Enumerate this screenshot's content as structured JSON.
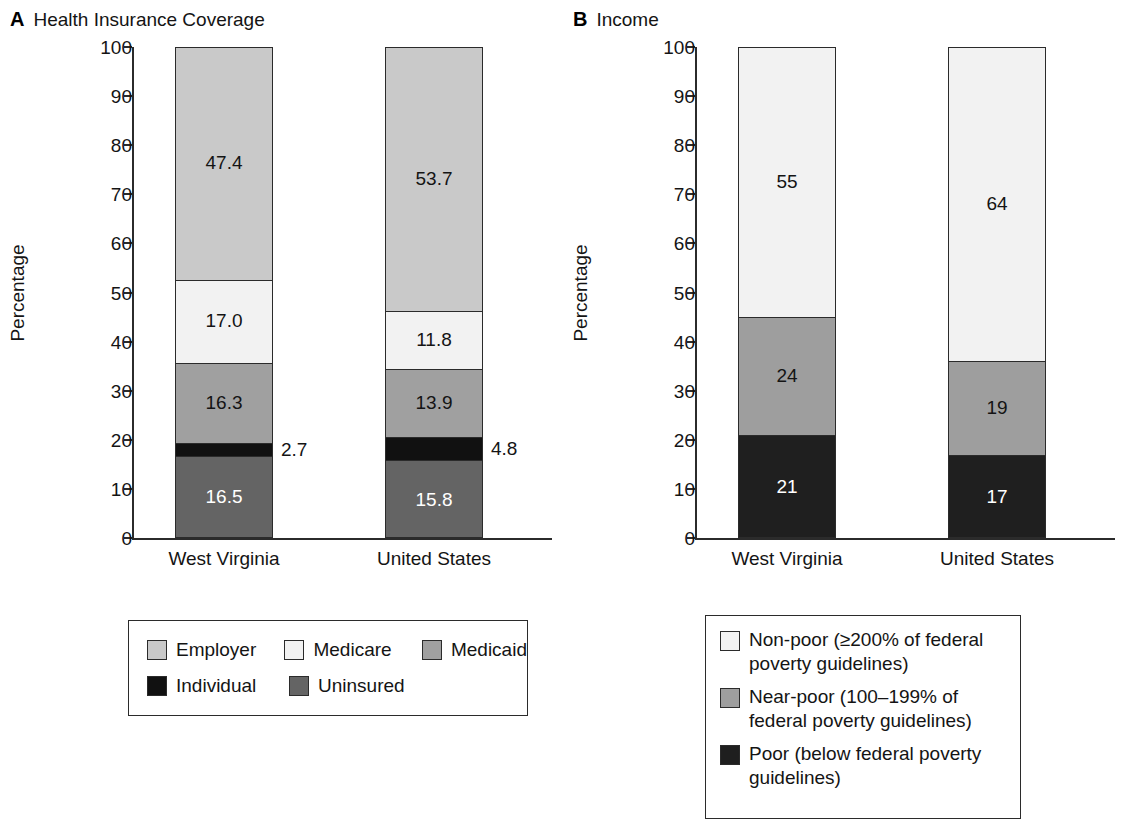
{
  "figure": {
    "background": "#ffffff"
  },
  "colors": {
    "employer": "#c9c9c9",
    "medicare": "#f2f2f2",
    "medicaid": "#a0a0a0",
    "individual": "#111111",
    "uninsured": "#646464",
    "non_poor": "#f2f2f2",
    "near_poor": "#9e9e9e",
    "poor": "#1f1f1f",
    "axis": "#2b2b2b",
    "text": "#141414"
  },
  "panels": [
    {
      "letter": "A",
      "title": "Health Insurance Coverage",
      "ylabel": "Percentage",
      "yticks": [
        "0",
        "10",
        "20",
        "30",
        "40",
        "50",
        "60",
        "70",
        "80",
        "90",
        "100"
      ],
      "categories": [
        "West Virginia",
        "United States"
      ],
      "legend": {
        "rows": [
          [
            {
              "label": "Employer",
              "color": "#c9c9c9"
            },
            {
              "label": "Medicare",
              "color": "#f2f2f2"
            },
            {
              "label": "Medicaid",
              "color": "#a0a0a0"
            }
          ],
          [
            {
              "label": "Individual",
              "color": "#111111"
            },
            {
              "label": "Uninsured",
              "color": "#646464"
            }
          ]
        ]
      },
      "bars": [
        {
          "category": "West Virginia",
          "segments": [
            {
              "name": "Employer",
              "value": 47.4,
              "label": "47.4",
              "color": "#c9c9c9",
              "label_color": "dark",
              "label_position": "inside"
            },
            {
              "name": "Medicare",
              "value": 17.0,
              "label": "17.0",
              "color": "#f2f2f2",
              "label_color": "dark",
              "label_position": "inside"
            },
            {
              "name": "Medicaid",
              "value": 16.3,
              "label": "16.3",
              "color": "#a0a0a0",
              "label_color": "dark",
              "label_position": "inside"
            },
            {
              "name": "Individual",
              "value": 2.7,
              "label": "2.7",
              "color": "#111111",
              "label_color": "dark",
              "label_position": "outside"
            },
            {
              "name": "Uninsured",
              "value": 16.5,
              "label": "16.5",
              "color": "#646464",
              "label_color": "light",
              "label_position": "inside"
            }
          ]
        },
        {
          "category": "United States",
          "segments": [
            {
              "name": "Employer",
              "value": 53.7,
              "label": "53.7",
              "color": "#c9c9c9",
              "label_color": "dark",
              "label_position": "inside"
            },
            {
              "name": "Medicare",
              "value": 11.8,
              "label": "11.8",
              "color": "#f2f2f2",
              "label_color": "dark",
              "label_position": "inside"
            },
            {
              "name": "Medicaid",
              "value": 13.9,
              "label": "13.9",
              "color": "#a0a0a0",
              "label_color": "dark",
              "label_position": "inside"
            },
            {
              "name": "Individual",
              "value": 4.8,
              "label": "4.8",
              "color": "#111111",
              "label_color": "dark",
              "label_position": "outside"
            },
            {
              "name": "Uninsured",
              "value": 15.8,
              "label": "15.8",
              "color": "#646464",
              "label_color": "light",
              "label_position": "inside"
            }
          ]
        }
      ]
    },
    {
      "letter": "B",
      "title": "Income",
      "ylabel": "Percentage",
      "yticks": [
        "0",
        "10",
        "20",
        "30",
        "40",
        "50",
        "60",
        "70",
        "80",
        "90",
        "100"
      ],
      "categories": [
        "West Virginia",
        "United States"
      ],
      "legend": {
        "rows": [
          [
            {
              "label": "Non-poor (≥200% of federal poverty guidelines)",
              "color": "#f2f2f2"
            }
          ],
          [
            {
              "label": "Near-poor (100–199% of federal poverty guidelines)",
              "color": "#9e9e9e"
            }
          ],
          [
            {
              "label": "Poor (below federal poverty guidelines)",
              "color": "#1f1f1f"
            }
          ]
        ]
      },
      "bars": [
        {
          "category": "West Virginia",
          "segments": [
            {
              "name": "Non-poor",
              "value": 55,
              "label": "55",
              "color": "#f2f2f2",
              "label_color": "dark",
              "label_position": "inside"
            },
            {
              "name": "Near-poor",
              "value": 24,
              "label": "24",
              "color": "#9e9e9e",
              "label_color": "dark",
              "label_position": "inside"
            },
            {
              "name": "Poor",
              "value": 21,
              "label": "21",
              "color": "#1f1f1f",
              "label_color": "light",
              "label_position": "inside"
            }
          ]
        },
        {
          "category": "United States",
          "segments": [
            {
              "name": "Non-poor",
              "value": 64,
              "label": "64",
              "color": "#f2f2f2",
              "label_color": "dark",
              "label_position": "inside"
            },
            {
              "name": "Near-poor",
              "value": 19,
              "label": "19",
              "color": "#9e9e9e",
              "label_color": "dark",
              "label_position": "inside"
            },
            {
              "name": "Poor",
              "value": 17,
              "label": "17",
              "color": "#1f1f1f",
              "label_color": "light",
              "label_position": "inside"
            }
          ]
        }
      ]
    }
  ],
  "chart_data": [
    {
      "type": "bar",
      "subtype": "stacked",
      "panel": "A",
      "title": "Health Insurance Coverage",
      "xlabel": "",
      "ylabel": "Percentage",
      "ylim": [
        0,
        100
      ],
      "yticks": [
        0,
        10,
        20,
        30,
        40,
        50,
        60,
        70,
        80,
        90,
        100
      ],
      "grid": false,
      "legend_position": "below",
      "categories": [
        "West Virginia",
        "United States"
      ],
      "series": [
        {
          "name": "Employer",
          "values": [
            47.4,
            53.7
          ]
        },
        {
          "name": "Medicare",
          "values": [
            17.0,
            11.8
          ]
        },
        {
          "name": "Medicaid",
          "values": [
            16.3,
            13.9
          ]
        },
        {
          "name": "Individual",
          "values": [
            2.7,
            4.8
          ]
        },
        {
          "name": "Uninsured",
          "values": [
            16.5,
            15.8
          ]
        }
      ],
      "annotations": [
        "2.7",
        "4.8"
      ]
    },
    {
      "type": "bar",
      "subtype": "stacked",
      "panel": "B",
      "title": "Income",
      "xlabel": "",
      "ylabel": "Percentage",
      "ylim": [
        0,
        100
      ],
      "yticks": [
        0,
        10,
        20,
        30,
        40,
        50,
        60,
        70,
        80,
        90,
        100
      ],
      "grid": false,
      "legend_position": "below",
      "categories": [
        "West Virginia",
        "United States"
      ],
      "series": [
        {
          "name": "Non-poor (≥200% of federal poverty guidelines)",
          "values": [
            55,
            64
          ]
        },
        {
          "name": "Near-poor (100–199% of federal poverty guidelines)",
          "values": [
            24,
            19
          ]
        },
        {
          "name": "Poor (below federal poverty guidelines)",
          "values": [
            21,
            17
          ]
        }
      ],
      "annotations": []
    }
  ]
}
